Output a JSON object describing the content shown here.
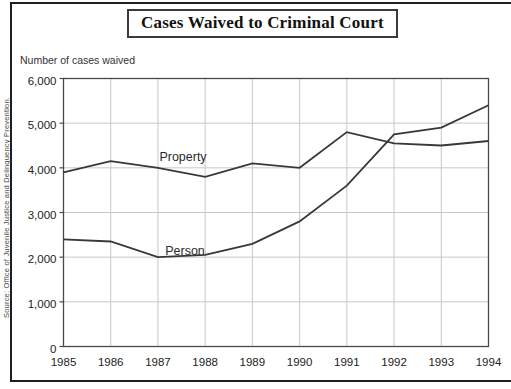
{
  "title": "Cases Waived to Criminal Court",
  "y_axis_caption": "Number of cases waived",
  "source": "Source: Office of Juvenile Justice and Delinquency Prevention.",
  "colors": {
    "line": "#383838",
    "grid": "#c8c8c8",
    "plot_border": "#4a4a4a",
    "tick_text": "#222222",
    "frame": "#1f1f1f"
  },
  "chart_data": {
    "type": "line",
    "title": "Cases Waived to Criminal Court",
    "xlabel": "",
    "ylabel": "Number of cases waived",
    "categories": [
      "1985",
      "1986",
      "1987",
      "1988",
      "1989",
      "1990",
      "1991",
      "1992",
      "1993",
      "1994"
    ],
    "series": [
      {
        "name": "Property",
        "values": [
          3900,
          4150,
          4000,
          3800,
          4100,
          4000,
          4800,
          4550,
          4500,
          4600
        ]
      },
      {
        "name": "Person",
        "values": [
          2400,
          2350,
          2000,
          2050,
          2300,
          2800,
          3600,
          4750,
          4900,
          5400
        ]
      }
    ],
    "ylim": [
      0,
      6000
    ],
    "ytick_interval": 1000,
    "ytick_labels": [
      "0",
      "1,000",
      "2,000",
      "3,000",
      "4,000",
      "5,000",
      "6,000"
    ],
    "grid": true,
    "legend": "inline-labels",
    "source": "Source: Office of Juvenile Justice and Delinquency Prevention."
  }
}
